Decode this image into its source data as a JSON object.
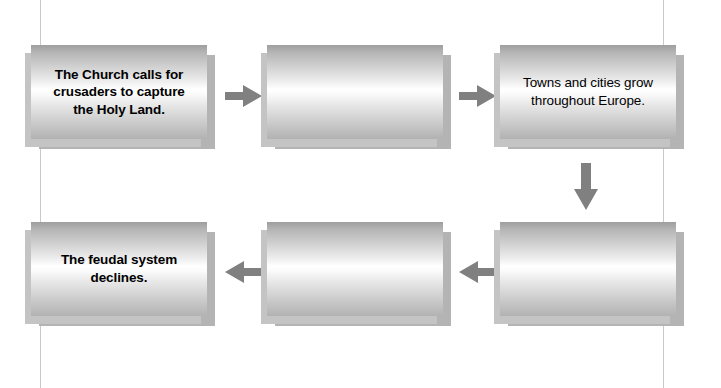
{
  "diagram": {
    "type": "flowchart",
    "title": "",
    "background_color": "#ffffff",
    "box_fill_highlight": "#ffffff",
    "box_fill_shadow": "#9e9e9e",
    "arrow_color": "#808080",
    "rule_color": "#c9c9c9",
    "text_color": "#000000",
    "boxes": [
      {
        "id": "box-1",
        "row": 1,
        "column": 1,
        "text": "The Church calls for crusaders to capture the Holy Land.",
        "weight": "bold",
        "filled": true
      },
      {
        "id": "box-2",
        "row": 1,
        "column": 2,
        "text": "",
        "weight": "bold",
        "filled": false
      },
      {
        "id": "box-3",
        "row": 1,
        "column": 3,
        "text": "Towns and cities grow throughout Europe.",
        "weight": "regular",
        "filled": true
      },
      {
        "id": "box-4",
        "row": 2,
        "column": 3,
        "text": "",
        "weight": "regular",
        "filled": false
      },
      {
        "id": "box-5",
        "row": 2,
        "column": 2,
        "text": "",
        "weight": "regular",
        "filled": false
      },
      {
        "id": "box-6",
        "row": 2,
        "column": 1,
        "text": "The feudal system declines.",
        "weight": "bold",
        "filled": true
      }
    ],
    "arrows": [
      {
        "id": "arrow-1",
        "direction": "right",
        "from": "box-1",
        "to": "box-2"
      },
      {
        "id": "arrow-2",
        "direction": "right",
        "from": "box-2",
        "to": "box-3"
      },
      {
        "id": "arrow-3",
        "direction": "down",
        "from": "box-3",
        "to": "box-4"
      },
      {
        "id": "arrow-4",
        "direction": "left",
        "from": "box-4",
        "to": "box-5"
      },
      {
        "id": "arrow-5",
        "direction": "left",
        "from": "box-5",
        "to": "box-6"
      }
    ]
  }
}
